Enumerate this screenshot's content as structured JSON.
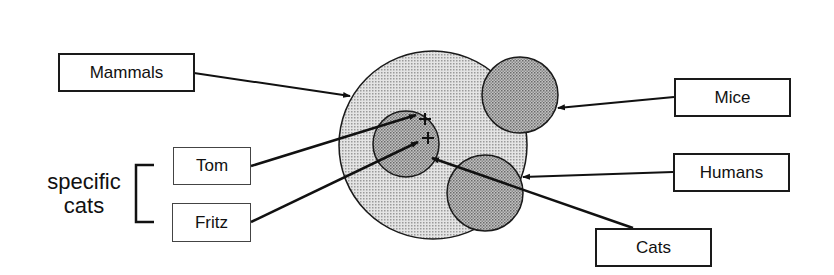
{
  "diagram": {
    "type": "set-membership",
    "sets": [
      {
        "id": "mammals",
        "label": "Mammals",
        "cx": 433,
        "cy": 145,
        "r": 94
      },
      {
        "id": "cats",
        "label": "Cats",
        "cx": 406,
        "cy": 144,
        "r": 33
      },
      {
        "id": "mice",
        "label": "Mice",
        "cx": 520,
        "cy": 95,
        "r": 38
      },
      {
        "id": "humans",
        "label": "Humans",
        "cx": 485,
        "cy": 193,
        "r": 38
      }
    ],
    "members": [
      {
        "label": "Tom",
        "set": "cats",
        "x": 425,
        "y": 120
      },
      {
        "label": "Fritz",
        "set": "cats",
        "x": 428,
        "y": 139
      }
    ],
    "group_label": "specific cats",
    "group_label_lines": [
      "specific",
      "cats"
    ],
    "colors": {
      "outer_fill": "#d6d6d6",
      "inner_fill": "#b4b4b4",
      "stroke": "#1a1a1a"
    }
  },
  "labels": {
    "mammals": "Mammals",
    "tom": "Tom",
    "fritz": "Fritz",
    "mice": "Mice",
    "humans": "Humans",
    "cats": "Cats",
    "specific": "specific",
    "cats_group": "cats"
  }
}
